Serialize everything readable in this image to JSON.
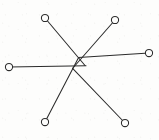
{
  "figure": {
    "type": "node-link-diagram",
    "background_color": "#fdfdfc",
    "stroke_color": "#2b2b2b",
    "node_fill_color": "#fdfdfc",
    "canvas": {
      "width": 159,
      "height": 140
    },
    "node_radius": 3.6,
    "edge_width": 1.05
  },
  "graph_data": {
    "type": "graph",
    "node_count": 6,
    "edge_count": 6,
    "layout": "straight-line drawing with near-central crossings",
    "nodes": [
      {
        "id": "n1",
        "label": "top-left",
        "x": 45,
        "y": 18
      },
      {
        "id": "n2",
        "label": "top-right",
        "x": 115,
        "y": 20
      },
      {
        "id": "n3",
        "label": "right",
        "x": 149,
        "y": 53
      },
      {
        "id": "n4",
        "label": "left",
        "x": 9,
        "y": 67
      },
      {
        "id": "n5",
        "label": "bottom-left",
        "x": 45,
        "y": 122
      },
      {
        "id": "n6",
        "label": "bottom-right",
        "x": 125,
        "y": 123
      }
    ],
    "center_crossing_triangle": [
      {
        "x": 78.5,
        "y": 57.5
      },
      {
        "x": 72.5,
        "y": 68.5
      },
      {
        "x": 85.0,
        "y": 65.5
      }
    ],
    "edges": [
      {
        "id": "e1",
        "from": "n1",
        "to": "tri_b",
        "x1": 45,
        "y1": 18,
        "x2": 85.0,
        "y2": 65.5
      },
      {
        "id": "e2",
        "from": "n2",
        "to": "tri_c",
        "x1": 115,
        "y1": 20,
        "x2": 72.5,
        "y2": 68.5
      },
      {
        "id": "e3",
        "from": "n3",
        "to": "tri_a",
        "x1": 149,
        "y1": 53,
        "x2": 78.5,
        "y2": 57.5
      },
      {
        "id": "e4",
        "from": "n4",
        "to": "tri_b2",
        "x1": 9,
        "y1": 67,
        "x2": 86.0,
        "y2": 65.8
      },
      {
        "id": "e5",
        "from": "n5",
        "to": "tri_a2",
        "x1": 45,
        "y1": 122,
        "x2": 78.6,
        "y2": 57.6
      },
      {
        "id": "e6",
        "from": "n6",
        "to": "tri_c2",
        "x1": 125,
        "y1": 123,
        "x2": 72.6,
        "y2": 68.4
      }
    ]
  }
}
